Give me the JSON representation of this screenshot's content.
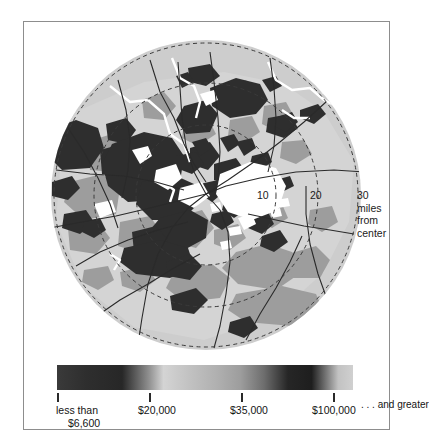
{
  "figure": {
    "type": "choropleth-map"
  },
  "map": {
    "rings": [
      {
        "label": "10",
        "miles": 10
      },
      {
        "label": "20",
        "miles": 20
      },
      {
        "label": "30",
        "miles": 30
      }
    ],
    "ring_units_line1": "miles",
    "ring_units_line2": "from",
    "ring_units_line3": "center",
    "colors": {
      "background": "#ffffff",
      "land": "#c9c9c9",
      "land_light": "#d8d8d8",
      "tract_mid": "#9a9a9a",
      "tract_dark": "#2f2f2f",
      "tract_white": "#ffffff",
      "road": "#2b2b2b",
      "water": "#ffffff",
      "ring_stroke": "#3a3a3a",
      "frame": "#8d8d8d"
    }
  },
  "legend": {
    "type": "continuous-gradient",
    "ticks": [
      {
        "label_line1": "less than",
        "label_line2": "$6,600",
        "value": 6600,
        "x_frac": 0.0
      },
      {
        "label_line1": "$20,000",
        "label_line2": "",
        "value": 20000,
        "x_frac": 0.3108
      },
      {
        "label_line1": "$35,000",
        "label_line2": "",
        "value": 35000,
        "x_frac": 0.6216
      },
      {
        "label_line1": "$100,000",
        "label_line2": "",
        "value": 100000,
        "x_frac": 0.9324
      }
    ],
    "and_greater_label": ". . . and greater",
    "gradient_stops": [
      {
        "pos": 0,
        "color": "#3a3a3a"
      },
      {
        "pos": 10,
        "color": "#2e2e2e"
      },
      {
        "pos": 22,
        "color": "#272727"
      },
      {
        "pos": 31,
        "color": "#8f8f8f"
      },
      {
        "pos": 36,
        "color": "#d4d4d4"
      },
      {
        "pos": 44,
        "color": "#c3c3c3"
      },
      {
        "pos": 54,
        "color": "#b0b0b0"
      },
      {
        "pos": 62,
        "color": "#9d9d9d"
      },
      {
        "pos": 70,
        "color": "#6d6d6d"
      },
      {
        "pos": 78,
        "color": "#262626"
      },
      {
        "pos": 86,
        "color": "#1e1e1e"
      },
      {
        "pos": 92,
        "color": "#8a8a8a"
      },
      {
        "pos": 95,
        "color": "#c2c2c2"
      },
      {
        "pos": 100,
        "color": "#d0d0d0"
      }
    ]
  }
}
